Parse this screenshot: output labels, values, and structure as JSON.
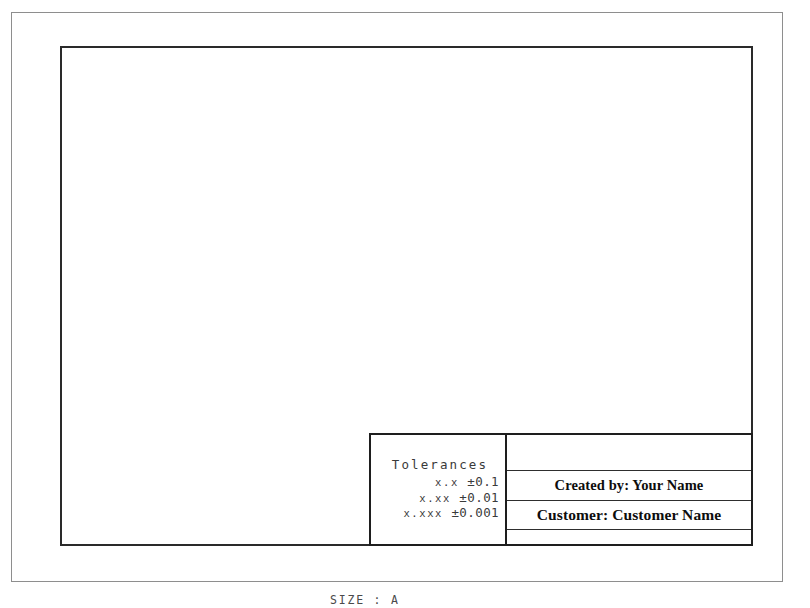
{
  "sheet": {
    "size_label": "SIZE : A",
    "border_color": "#8e8e8e",
    "inner_border_color": "#2a2a2a",
    "background": "#ffffff"
  },
  "title_block": {
    "tolerances": {
      "heading": "Tolerances",
      "lines": [
        {
          "vars": "x.x",
          "value": "±0.1"
        },
        {
          "vars": "x.xx",
          "value": "±0.01"
        },
        {
          "vars": "x.xxx",
          "value": "±0.001"
        }
      ]
    },
    "rows": [
      {
        "label": ""
      },
      {
        "label": "Created by: Your Name"
      },
      {
        "label": "Customer: Customer Name"
      },
      {
        "label": ""
      }
    ]
  }
}
